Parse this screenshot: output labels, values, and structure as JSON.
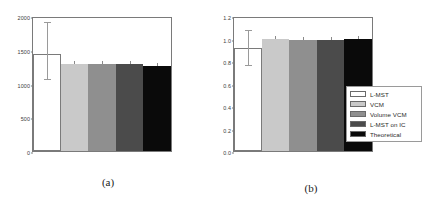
{
  "figure": {
    "background": "#ffffff",
    "panels": [
      {
        "id": "a",
        "caption": "(a)",
        "chart_data": {
          "type": "bar",
          "title": "",
          "xlabel": "",
          "ylabel": "",
          "categories": [
            "L-MST",
            "VCM",
            "Volume VCM",
            "L-MST on IC",
            "Theoretical"
          ],
          "values": [
            1437,
            1289,
            1289,
            1289,
            1260
          ],
          "errors": [
            {
              "low": 1050,
              "high": 1900
            },
            null,
            null,
            null,
            null
          ],
          "ylim": [
            0,
            2000
          ],
          "yticks": [
            0,
            500,
            1000,
            1500,
            2000
          ],
          "ytick_labels": [
            "0",
            "500",
            "1000",
            "1500",
            "2000"
          ],
          "grid": false,
          "legend": "outside-right"
        }
      },
      {
        "id": "b",
        "caption": "(b)",
        "chart_data": {
          "type": "bar",
          "title": "",
          "xlabel": "",
          "ylabel": "",
          "categories": [
            "L-MST",
            "VCM",
            "Volume VCM",
            "L-MST on IC",
            "Theoretical"
          ],
          "values": [
            0.92,
            0.995,
            0.99,
            0.99,
            0.995
          ],
          "errors": [
            {
              "low": 0.755,
              "high": 1.065
            },
            null,
            null,
            null,
            null
          ],
          "ylim": [
            0.0,
            1.2
          ],
          "yticks": [
            0.0,
            0.2,
            0.4,
            0.6,
            0.8,
            1.0,
            1.2
          ],
          "ytick_labels": [
            "0.0",
            "0.2",
            "0.4",
            "0.6",
            "0.8",
            "1.0",
            "1.2"
          ],
          "grid": false,
          "legend": "outside-right"
        }
      }
    ]
  },
  "legend": {
    "items": [
      {
        "label": "L-MST",
        "color": "#ffffff"
      },
      {
        "label": "VCM",
        "color": "#c9c9c9"
      },
      {
        "label": "Volume VCM",
        "color": "#8f8f8f"
      },
      {
        "label": "L-MST on IC",
        "color": "#4b4b4b"
      },
      {
        "label": "Theoretical",
        "color": "#0a0a0a"
      }
    ]
  },
  "colors": {
    "axis": "#7a7a7a",
    "error": "#9a9a9a",
    "text": "#2b2b2b"
  }
}
